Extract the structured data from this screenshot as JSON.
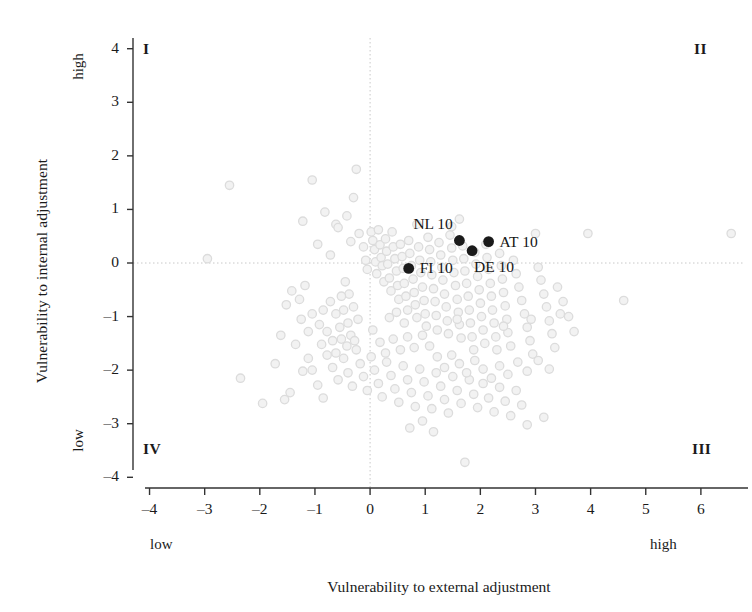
{
  "chart_data": {
    "type": "scatter",
    "title": "",
    "xlabel": "Vulnerability to external adjustment",
    "ylabel": "Vulnerability to internal adjustment",
    "xlim": [
      -4.3,
      6.8
    ],
    "ylim": [
      -4.2,
      4.2
    ],
    "xticks": [
      -4,
      -3,
      -2,
      -1,
      0,
      1,
      2,
      3,
      4,
      5,
      6
    ],
    "yticks": [
      -4,
      -3,
      -2,
      -1,
      0,
      1,
      2,
      3,
      4
    ],
    "xtick_labels": [
      "–4",
      "–3",
      "–2",
      "–1",
      "0",
      "1",
      "2",
      "3",
      "4",
      "5",
      "6"
    ],
    "ytick_labels": [
      "–4",
      "–3",
      "–2",
      "–1",
      "0",
      "1",
      "2",
      "3",
      "4"
    ],
    "x_axis_low_label": "low",
    "x_axis_high_label": "high",
    "y_axis_low_label": "low",
    "y_axis_high_label": "high",
    "grid": false,
    "reference_lines": {
      "x": 0,
      "y": 0,
      "style": "dotted",
      "color": "#c8c8c8"
    },
    "legend": "none",
    "quadrants": [
      {
        "name": "I",
        "label": "I",
        "position": "top-left"
      },
      {
        "name": "II",
        "label": "II",
        "position": "top-right"
      },
      {
        "name": "III",
        "label": "III",
        "position": "bottom-right"
      },
      {
        "name": "IV",
        "label": "IV",
        "position": "bottom-left"
      }
    ],
    "series": [
      {
        "name": "countries",
        "marker": "circle-open",
        "color": "#dcdcdc",
        "points": [
          [
            -2.55,
            1.45
          ],
          [
            -2.95,
            0.08
          ],
          [
            -1.05,
            1.55
          ],
          [
            -1.22,
            0.78
          ],
          [
            -0.82,
            0.95
          ],
          [
            -0.62,
            0.72
          ],
          [
            -0.58,
            0.66
          ],
          [
            -0.42,
            0.88
          ],
          [
            -0.35,
            0.4
          ],
          [
            -0.3,
            1.22
          ],
          [
            -0.25,
            1.75
          ],
          [
            -0.2,
            0.55
          ],
          [
            -0.12,
            0.3
          ],
          [
            -0.08,
            0.05
          ],
          [
            -0.05,
            -0.12
          ],
          [
            0.02,
            0.58
          ],
          [
            0.05,
            0.42
          ],
          [
            0.08,
            0.25
          ],
          [
            0.1,
            0.02
          ],
          [
            0.12,
            -0.2
          ],
          [
            0.15,
            0.62
          ],
          [
            0.18,
            0.34
          ],
          [
            0.2,
            0.1
          ],
          [
            0.22,
            -0.05
          ],
          [
            0.25,
            -0.35
          ],
          [
            0.28,
            0.45
          ],
          [
            0.3,
            0.22
          ],
          [
            0.32,
            -0.02
          ],
          [
            0.35,
            -0.28
          ],
          [
            0.38,
            -0.52
          ],
          [
            0.4,
            0.58
          ],
          [
            0.42,
            0.3
          ],
          [
            0.45,
            0.08
          ],
          [
            0.48,
            -0.15
          ],
          [
            0.5,
            -0.42
          ],
          [
            0.52,
            -0.68
          ],
          [
            0.55,
            0.35
          ],
          [
            0.58,
            0.12
          ],
          [
            0.6,
            -0.1
          ],
          [
            0.62,
            -0.38
          ],
          [
            0.65,
            -0.62
          ],
          [
            0.68,
            -0.88
          ],
          [
            0.7,
            0.42
          ],
          [
            0.72,
            0.18
          ],
          [
            0.75,
            -0.05
          ],
          [
            0.78,
            -0.3
          ],
          [
            0.8,
            -0.55
          ],
          [
            0.82,
            -0.78
          ],
          [
            0.85,
            -1.02
          ],
          [
            0.88,
            0.3
          ],
          [
            0.9,
            0.05
          ],
          [
            0.92,
            -0.18
          ],
          [
            0.95,
            -0.45
          ],
          [
            0.98,
            -0.7
          ],
          [
            1.0,
            -0.95
          ],
          [
            1.02,
            -1.18
          ],
          [
            1.05,
            0.48
          ],
          [
            1.08,
            0.25
          ],
          [
            1.1,
            0.02
          ],
          [
            1.12,
            -0.22
          ],
          [
            1.15,
            -0.48
          ],
          [
            1.18,
            -0.72
          ],
          [
            1.2,
            -0.98
          ],
          [
            1.22,
            -1.25
          ],
          [
            1.25,
            0.38
          ],
          [
            1.28,
            0.15
          ],
          [
            1.3,
            -0.08
          ],
          [
            1.32,
            -0.32
          ],
          [
            1.35,
            -0.58
          ],
          [
            1.38,
            -0.82
          ],
          [
            1.4,
            -1.08
          ],
          [
            1.42,
            -1.32
          ],
          [
            1.45,
            0.52
          ],
          [
            1.48,
            0.28
          ],
          [
            1.5,
            0.05
          ],
          [
            1.52,
            -0.18
          ],
          [
            1.55,
            -0.42
          ],
          [
            1.58,
            -0.68
          ],
          [
            1.6,
            -0.92
          ],
          [
            1.62,
            -1.15
          ],
          [
            1.65,
            -1.4
          ],
          [
            1.68,
            0.32
          ],
          [
            1.7,
            0.08
          ],
          [
            1.72,
            -0.15
          ],
          [
            1.75,
            -0.38
          ],
          [
            1.78,
            -0.62
          ],
          [
            1.8,
            -0.88
          ],
          [
            1.82,
            -1.12
          ],
          [
            1.85,
            -1.38
          ],
          [
            1.88,
            -1.62
          ],
          [
            1.9,
            0.2
          ],
          [
            1.92,
            -0.02
          ],
          [
            1.95,
            -0.25
          ],
          [
            1.98,
            -0.5
          ],
          [
            2.0,
            -0.75
          ],
          [
            2.02,
            -1.0
          ],
          [
            2.05,
            -1.25
          ],
          [
            2.08,
            -1.5
          ],
          [
            2.1,
            0.35
          ],
          [
            2.12,
            0.1
          ],
          [
            2.15,
            -0.12
          ],
          [
            2.18,
            -0.38
          ],
          [
            2.2,
            -0.62
          ],
          [
            2.22,
            -0.88
          ],
          [
            2.25,
            -1.12
          ],
          [
            2.28,
            -1.38
          ],
          [
            2.3,
            -1.62
          ],
          [
            2.35,
            0.18
          ],
          [
            2.38,
            -0.05
          ],
          [
            2.4,
            -0.3
          ],
          [
            2.42,
            -0.55
          ],
          [
            2.45,
            -0.8
          ],
          [
            2.48,
            -1.05
          ],
          [
            2.5,
            -1.3
          ],
          [
            2.55,
            -1.55
          ],
          [
            2.6,
            0.05
          ],
          [
            2.65,
            -0.2
          ],
          [
            2.7,
            -0.45
          ],
          [
            2.75,
            -0.7
          ],
          [
            2.8,
            -0.95
          ],
          [
            2.85,
            -1.2
          ],
          [
            2.9,
            -1.45
          ],
          [
            2.95,
            -1.7
          ],
          [
            3.0,
            0.55
          ],
          [
            3.05,
            -0.08
          ],
          [
            3.1,
            -0.32
          ],
          [
            3.15,
            -0.58
          ],
          [
            3.2,
            -0.82
          ],
          [
            3.25,
            -1.08
          ],
          [
            3.3,
            -1.32
          ],
          [
            3.35,
            -1.58
          ],
          [
            3.4,
            -0.45
          ],
          [
            3.5,
            -0.72
          ],
          [
            3.6,
            -1.0
          ],
          [
            3.7,
            -1.28
          ],
          [
            3.95,
            0.55
          ],
          [
            4.6,
            -0.7
          ],
          [
            6.55,
            0.55
          ],
          [
            -0.45,
            -0.35
          ],
          [
            -0.38,
            -0.58
          ],
          [
            -0.3,
            -0.82
          ],
          [
            -0.22,
            -1.05
          ],
          [
            -0.52,
            -0.62
          ],
          [
            -0.48,
            -0.88
          ],
          [
            -0.4,
            -1.12
          ],
          [
            -0.35,
            -1.35
          ],
          [
            -0.62,
            -0.95
          ],
          [
            -0.55,
            -1.2
          ],
          [
            -0.68,
            -1.45
          ],
          [
            -0.72,
            -0.72
          ],
          [
            -0.85,
            -0.88
          ],
          [
            -0.92,
            -1.15
          ],
          [
            -1.05,
            -0.95
          ],
          [
            -1.12,
            -1.28
          ],
          [
            -1.25,
            -1.05
          ],
          [
            -1.35,
            -1.52
          ],
          [
            -1.45,
            -2.42
          ],
          [
            -1.55,
            -2.55
          ],
          [
            -1.05,
            -2.0
          ],
          [
            -0.95,
            -2.28
          ],
          [
            -0.85,
            -2.52
          ],
          [
            -0.78,
            -1.72
          ],
          [
            -0.68,
            -1.95
          ],
          [
            -0.58,
            -2.18
          ],
          [
            -0.48,
            -1.78
          ],
          [
            -0.4,
            -2.05
          ],
          [
            -0.32,
            -2.3
          ],
          [
            -0.25,
            -1.62
          ],
          [
            -0.18,
            -1.88
          ],
          [
            -0.12,
            -2.12
          ],
          [
            -0.05,
            -2.38
          ],
          [
            0.02,
            -1.75
          ],
          [
            0.08,
            -2.0
          ],
          [
            0.15,
            -2.25
          ],
          [
            0.22,
            -2.5
          ],
          [
            0.3,
            -1.85
          ],
          [
            0.38,
            -2.1
          ],
          [
            0.45,
            -2.35
          ],
          [
            0.52,
            -2.6
          ],
          [
            0.6,
            -1.92
          ],
          [
            0.68,
            -2.18
          ],
          [
            0.75,
            -2.42
          ],
          [
            0.82,
            -2.68
          ],
          [
            0.9,
            -1.98
          ],
          [
            0.98,
            -2.22
          ],
          [
            1.05,
            -2.48
          ],
          [
            1.12,
            -2.72
          ],
          [
            1.2,
            -2.05
          ],
          [
            1.28,
            -2.3
          ],
          [
            1.35,
            -2.55
          ],
          [
            1.42,
            -2.8
          ],
          [
            1.5,
            -2.12
          ],
          [
            1.58,
            -2.38
          ],
          [
            1.65,
            -2.62
          ],
          [
            1.72,
            -3.72
          ],
          [
            1.8,
            -2.18
          ],
          [
            1.88,
            -2.45
          ],
          [
            1.95,
            -2.7
          ],
          [
            2.05,
            -2.25
          ],
          [
            2.15,
            -2.52
          ],
          [
            2.25,
            -2.78
          ],
          [
            2.35,
            -2.32
          ],
          [
            2.45,
            -2.58
          ],
          [
            2.55,
            -2.85
          ],
          [
            2.65,
            -2.38
          ],
          [
            2.75,
            -2.65
          ],
          [
            -1.18,
            -0.42
          ],
          [
            -1.28,
            -0.68
          ],
          [
            -1.42,
            -0.52
          ],
          [
            -1.52,
            -0.78
          ],
          [
            -1.12,
            -1.78
          ],
          [
            -1.22,
            -2.02
          ],
          [
            -0.88,
            -1.52
          ],
          [
            -0.78,
            -1.28
          ],
          [
            -0.62,
            -1.68
          ],
          [
            -0.52,
            -1.42
          ],
          [
            -0.42,
            -1.55
          ],
          [
            -0.28,
            -1.45
          ],
          [
            0.05,
            -1.25
          ],
          [
            0.18,
            -1.48
          ],
          [
            0.28,
            -1.68
          ],
          [
            0.42,
            -1.42
          ],
          [
            0.55,
            -1.62
          ],
          [
            0.68,
            -1.38
          ],
          [
            0.8,
            -1.58
          ],
          [
            0.95,
            -1.35
          ],
          [
            1.08,
            -1.55
          ],
          [
            1.22,
            -1.75
          ],
          [
            1.35,
            -1.95
          ],
          [
            1.48,
            -1.72
          ],
          [
            1.62,
            -1.88
          ],
          [
            1.75,
            -2.05
          ],
          [
            1.9,
            -1.82
          ],
          [
            2.05,
            -1.98
          ],
          [
            2.2,
            -2.15
          ],
          [
            2.35,
            -1.92
          ],
          [
            2.5,
            -2.08
          ],
          [
            2.68,
            -1.85
          ],
          [
            2.85,
            -2.02
          ],
          [
            3.05,
            -1.82
          ],
          [
            3.25,
            -1.98
          ],
          [
            -2.35,
            -2.15
          ],
          [
            -1.95,
            -2.62
          ],
          [
            0.72,
            -3.08
          ],
          [
            0.95,
            -2.95
          ],
          [
            1.15,
            -3.15
          ],
          [
            2.85,
            -3.02
          ],
          [
            3.15,
            -2.88
          ],
          [
            -1.72,
            -1.88
          ],
          [
            -1.62,
            -1.35
          ],
          [
            0.48,
            -0.92
          ],
          [
            0.62,
            -1.12
          ],
          [
            0.35,
            -1.02
          ],
          [
            1.58,
            -1.05
          ],
          [
            2.42,
            -1.18
          ],
          [
            2.92,
            -1.05
          ],
          [
            3.45,
            -0.95
          ],
          [
            -0.95,
            0.35
          ],
          [
            -0.72,
            0.15
          ],
          [
            1.48,
            0.68
          ],
          [
            1.62,
            0.82
          ],
          [
            0.85,
            0.72
          ]
        ]
      },
      {
        "name": "highlighted-countries",
        "marker": "circle-filled",
        "color": "#1a1a1a",
        "points": [
          {
            "label": "NL 10",
            "x": 1.62,
            "y": 0.42,
            "label_pos": "above-left"
          },
          {
            "label": "AT 10",
            "x": 2.15,
            "y": 0.4,
            "label_pos": "right"
          },
          {
            "label": "DE 10",
            "x": 1.85,
            "y": 0.23,
            "label_pos": "below-right"
          },
          {
            "label": "FI 10",
            "x": 0.7,
            "y": -0.1,
            "label_pos": "right"
          }
        ]
      }
    ]
  }
}
